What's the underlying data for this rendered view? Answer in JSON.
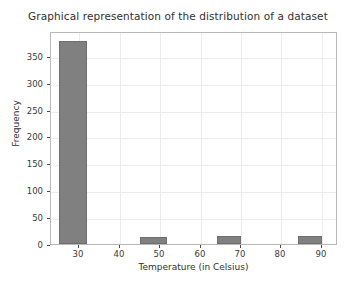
{
  "chart_data": {
    "type": "bar",
    "title": "Graphical representation of the distribution of a dataset",
    "xlabel": "Temperature (in Celsius)",
    "ylabel": "Frequency",
    "xlim": [
      23.0,
      94.0
    ],
    "ylim": [
      0,
      396
    ],
    "grid": true,
    "legend": null,
    "bar_color": "#808080",
    "bar_edge_color": "#6e6e6e",
    "grid_color": "#ececec",
    "axes_color": "#b8b8b8",
    "xticks": [
      30,
      40,
      50,
      60,
      70,
      80,
      90
    ],
    "xtick_labels": [
      "30",
      "40",
      "50",
      "60",
      "70",
      "80",
      "90"
    ],
    "yticks": [
      0,
      50,
      100,
      150,
      200,
      250,
      300,
      350
    ],
    "ytick_labels": [
      "0",
      "50",
      "100",
      "150",
      "200",
      "250",
      "300",
      "350"
    ],
    "bins": [
      {
        "left": 25.0,
        "right": 31.8,
        "value": 378
      },
      {
        "left": 45.0,
        "right": 51.8,
        "value": 13
      },
      {
        "left": 64.0,
        "right": 70.0,
        "value": 14
      },
      {
        "left": 84.0,
        "right": 90.0,
        "value": 14
      }
    ],
    "categories": [
      "25.0-31.8",
      "45.0-51.8",
      "64.0-70.0",
      "84.0-90.0"
    ],
    "values": [
      378,
      13,
      14,
      14
    ]
  }
}
